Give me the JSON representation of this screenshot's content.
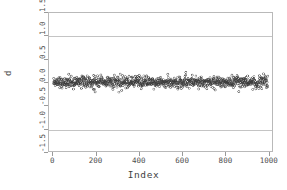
{
  "chart_data": {
    "type": "scatter",
    "title": "",
    "xlabel": "Index",
    "ylabel": "d",
    "xlim": [
      -20,
      1020
    ],
    "ylim": [
      -1.5,
      1.5
    ],
    "xticks": [
      0,
      200,
      400,
      600,
      800,
      1000
    ],
    "xtick_labels": [
      "0",
      "200",
      "400",
      "600",
      "800",
      "1000"
    ],
    "yticks": [
      -1.5,
      -1.0,
      -0.5,
      0.0,
      0.5,
      1.0,
      1.5
    ],
    "ytick_labels": [
      "-1.5",
      "-1.0",
      "-0.5",
      "0.0",
      "0.5",
      "1.0",
      "1.5"
    ],
    "grid": true,
    "gridlines_y": [
      1.0,
      -1.0
    ],
    "legend": null,
    "n_points": 1000,
    "marker": "open-circle",
    "marker_size": 2.1,
    "marker_color": "#3a3a3a",
    "series": [
      {
        "name": "d",
        "description": "residual-like series centered near 0.0 with roughly constant spread",
        "x_start": 1,
        "x_end": 1000,
        "x_step": 1,
        "y_mean": 0.0,
        "y_sd": 0.062,
        "y_observed_min": -0.22,
        "y_observed_max": 0.22
      }
    ],
    "colors": {
      "frame": "#b9b9b9",
      "grid": "#c4c4c4",
      "tick": "#9a9a9a",
      "text": "#4e4e4e",
      "background": "#ffffff",
      "points": "#3a3a3a"
    }
  }
}
